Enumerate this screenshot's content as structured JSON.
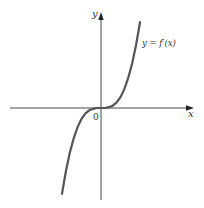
{
  "chart_data": {
    "type": "line",
    "title": "",
    "xlabel": "x",
    "ylabel": "y",
    "origin_label": "0",
    "xlim": [
      -2.6,
      2.4
    ],
    "ylim": [
      -2.3,
      2.4
    ],
    "grid": false,
    "series": [
      {
        "name": "y = f′(x)",
        "label": "y = f′(x)",
        "x": [
          -1.0,
          -0.9,
          -0.8,
          -0.7,
          -0.6,
          -0.5,
          -0.4,
          -0.3,
          -0.2,
          -0.1,
          0.0,
          0.1,
          0.2,
          0.3,
          0.4,
          0.5,
          0.6,
          0.7,
          0.8,
          0.9,
          1.0
        ],
        "y": [
          -2.2,
          -1.62,
          -1.15,
          -0.78,
          -0.49,
          -0.28,
          -0.14,
          -0.06,
          -0.02,
          0.0,
          0.0,
          0.0,
          0.02,
          0.06,
          0.14,
          0.28,
          0.49,
          0.78,
          1.15,
          1.62,
          2.2
        ]
      }
    ],
    "colors": {
      "curve": "#555555",
      "axis": "#333333"
    }
  }
}
